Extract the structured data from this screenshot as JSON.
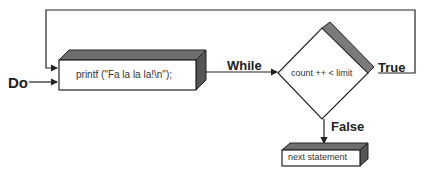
{
  "diagram": {
    "type": "flowchart",
    "labels": {
      "entry": "Do",
      "loop_edge": "While",
      "true_branch": "True",
      "false_branch": "False"
    },
    "nodes": {
      "statement": "printf (\"Fa la la la!\\n\");",
      "condition": "count ++ < limit",
      "next": "next statement"
    },
    "colors": {
      "line": "#222222",
      "shade": "#7a7a7a",
      "fill": "#ffffff"
    }
  }
}
